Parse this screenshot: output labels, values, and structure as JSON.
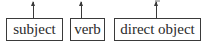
{
  "diagram": {
    "boxes": [
      {
        "label": "subject"
      },
      {
        "label": "verb"
      },
      {
        "label": "direct object"
      }
    ],
    "arrow_direction": "up",
    "colors": {
      "stroke": "#3a3a3a",
      "text": "#2a2a2a",
      "background": "#ffffff"
    }
  }
}
